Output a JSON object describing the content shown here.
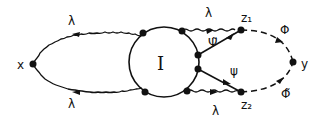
{
  "diagram": {
    "type": "feynman-diagram",
    "blob_label": "I",
    "external_vertices": {
      "left": "x",
      "right": "y"
    },
    "internal_vertices": {
      "upper": "z₁",
      "lower": "z₂"
    },
    "propagator_labels": {
      "upper_left_wavy": "λ",
      "lower_left_wavy": "λ",
      "upper_right_wavy": "λ",
      "lower_right_wavy": "λ",
      "fermion_upper": "Ψ̃",
      "fermion_lower": "ψ",
      "dashed_upper": "Φ",
      "dashed_lower": "Φ̃"
    },
    "colors": {
      "line": "#111111",
      "background": "#ffffff"
    }
  }
}
